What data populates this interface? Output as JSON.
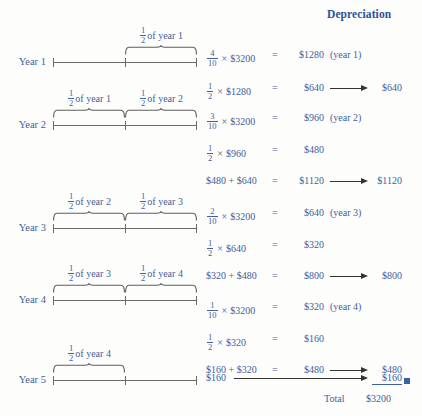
{
  "title": "Depreciation",
  "colors": {
    "text_blue": "#41609e",
    "header_blue": "#2f4f9b",
    "line_gray": "#6b6b6b",
    "arrow_black": "#333333",
    "marker_blue": "#3a5fa8"
  },
  "total_label": "Total",
  "total_value": "$3200",
  "rows": [
    {
      "year_label": "Year 1",
      "braces": [
        {
          "caption_num": "1",
          "caption_den": "2",
          "caption_text": "of year 1",
          "span": "second-half"
        }
      ]
    },
    {
      "year_label": "Year 2",
      "braces": [
        {
          "caption_num": "1",
          "caption_den": "2",
          "caption_text": "of year 1",
          "span": "first-half"
        },
        {
          "caption_num": "1",
          "caption_den": "2",
          "caption_text": "of year 2",
          "span": "second-half"
        }
      ]
    },
    {
      "year_label": "Year 3",
      "braces": [
        {
          "caption_num": "1",
          "caption_den": "2",
          "caption_text": "of year 2",
          "span": "first-half"
        },
        {
          "caption_num": "1",
          "caption_den": "2",
          "caption_text": "of year 3",
          "span": "second-half"
        }
      ]
    },
    {
      "year_label": "Year 4",
      "braces": [
        {
          "caption_num": "1",
          "caption_den": "2",
          "caption_text": "of year 3",
          "span": "first-half"
        },
        {
          "caption_num": "1",
          "caption_den": "2",
          "caption_text": "of year 4",
          "span": "second-half"
        }
      ]
    },
    {
      "year_label": "Year 5",
      "braces": [
        {
          "caption_num": "1",
          "caption_den": "2",
          "caption_text": "of year 4",
          "span": "first-half"
        }
      ]
    }
  ],
  "equations": [
    {
      "id": "eq1",
      "kind": "fraction",
      "num": "4",
      "den": "10",
      "times": "×",
      "operand": "$3200",
      "equals": "=",
      "result": "$1280",
      "note": "(year 1)",
      "arrow": false,
      "depreciation": ""
    },
    {
      "id": "eq2",
      "kind": "fraction",
      "num": "1",
      "den": "2",
      "times": "×",
      "operand": "$1280",
      "equals": "=",
      "result": "$640",
      "note": "",
      "arrow": true,
      "depreciation": "$640"
    },
    {
      "id": "eq3",
      "kind": "fraction",
      "num": "3",
      "den": "10",
      "times": "×",
      "operand": "$3200",
      "equals": "=",
      "result": "$960",
      "note": "(year 2)",
      "arrow": false,
      "depreciation": ""
    },
    {
      "id": "eq4",
      "kind": "fraction",
      "num": "1",
      "den": "2",
      "times": "×",
      "operand": "$960",
      "equals": "=",
      "result": "$480",
      "note": "",
      "arrow": false,
      "depreciation": ""
    },
    {
      "id": "eq5",
      "kind": "sum",
      "left": "$480 + $640",
      "equals": "=",
      "result": "$1120",
      "note": "",
      "arrow": true,
      "depreciation": "$1120"
    },
    {
      "id": "eq6",
      "kind": "fraction",
      "num": "2",
      "den": "10",
      "times": "×",
      "operand": "$3200",
      "equals": "=",
      "result": "$640",
      "note": "(year 3)",
      "arrow": false,
      "depreciation": ""
    },
    {
      "id": "eq7",
      "kind": "fraction",
      "num": "1",
      "den": "2",
      "times": "×",
      "operand": "$640",
      "equals": "=",
      "result": "$320",
      "note": "",
      "arrow": false,
      "depreciation": ""
    },
    {
      "id": "eq8",
      "kind": "sum",
      "left": "$320 + $480",
      "equals": "=",
      "result": "$800",
      "note": "",
      "arrow": true,
      "depreciation": "$800"
    },
    {
      "id": "eq9",
      "kind": "fraction",
      "num": "1",
      "den": "10",
      "times": "×",
      "operand": "$3200",
      "equals": "=",
      "result": "$320",
      "note": "(year 4)",
      "arrow": false,
      "depreciation": ""
    },
    {
      "id": "eq10",
      "kind": "fraction",
      "num": "1",
      "den": "2",
      "times": "×",
      "operand": "$320",
      "equals": "=",
      "result": "$160",
      "note": "",
      "arrow": false,
      "depreciation": ""
    },
    {
      "id": "eq11",
      "kind": "sum",
      "left": "$160 + $320",
      "equals": "=",
      "result": "$480",
      "note": "",
      "arrow": true,
      "depreciation": "$480"
    },
    {
      "id": "eq12",
      "kind": "plain",
      "left": "$160",
      "equals": "",
      "result": "",
      "note": "",
      "arrow": true,
      "depreciation": "$160"
    }
  ]
}
